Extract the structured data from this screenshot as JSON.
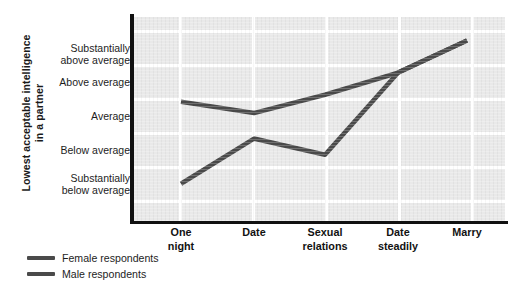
{
  "chart_data": {
    "type": "line",
    "title": "",
    "xlabel": "",
    "ylabel": "Lowest acceptable intelligence in a partner",
    "ylabel_lines": [
      "Lowest acceptable intelligence",
      "in a partner"
    ],
    "categories": [
      "One night",
      "Date",
      "Sexual relations",
      "Date steadily",
      "Marry"
    ],
    "category_lines": [
      [
        "One",
        "night"
      ],
      [
        "Date"
      ],
      [
        "Sexual",
        "relations"
      ],
      [
        "Date",
        "steadily"
      ],
      [
        "Marry"
      ]
    ],
    "ytick_labels": [
      "Substantially above average",
      "Above average",
      "Average",
      "Below average",
      "Substantially below average"
    ],
    "ytick_label_lines": [
      [
        "Substantially",
        "above average"
      ],
      [
        "Above average"
      ],
      [
        "Average"
      ],
      [
        "Below average"
      ],
      [
        "Substantially",
        "below average"
      ]
    ],
    "ytick_values": [
      2,
      1,
      0,
      -1,
      -2
    ],
    "ylim": [
      -2.6,
      2.6
    ],
    "grid": true,
    "legend_position": "below-left",
    "series": [
      {
        "name": "Female respondents",
        "color": "#4a4a4a",
        "values": [
          0.44,
          0.15,
          0.62,
          1.18,
          2.0
        ]
      },
      {
        "name": "Male respondents",
        "color": "#4a4a4a",
        "values": [
          -1.65,
          -0.5,
          -0.91,
          1.18,
          2.0
        ]
      }
    ]
  },
  "legend": {
    "items": [
      {
        "label": "Female respondents",
        "color": "#4a4a4a"
      },
      {
        "label": "Male respondents",
        "color": "#4a4a4a"
      }
    ]
  },
  "colors": {
    "plot_background": "#e9e9e9",
    "gridline": "#ffffff",
    "axis": "#111111",
    "line": "#4a4a4a",
    "text": "#1d1d1d"
  }
}
